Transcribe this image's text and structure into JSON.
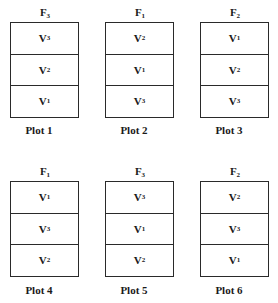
{
  "diagram": {
    "title": "",
    "plots": [
      {
        "label": "Plot 1",
        "factor": {
          "base": "F",
          "sub": "3"
        },
        "varieties": [
          {
            "base": "V",
            "sub": "3"
          },
          {
            "base": "V",
            "sub": "2"
          },
          {
            "base": "V",
            "sub": "1"
          }
        ]
      },
      {
        "label": "Plot 2",
        "factor": {
          "base": "F",
          "sub": "1"
        },
        "varieties": [
          {
            "base": "V",
            "sub": "2"
          },
          {
            "base": "V",
            "sub": "1"
          },
          {
            "base": "V",
            "sub": "3"
          }
        ]
      },
      {
        "label": "Plot 3",
        "factor": {
          "base": "F",
          "sub": "2"
        },
        "varieties": [
          {
            "base": "V",
            "sub": "1"
          },
          {
            "base": "V",
            "sub": "2"
          },
          {
            "base": "V",
            "sub": "3"
          }
        ]
      },
      {
        "label": "Plot 4",
        "factor": {
          "base": "F",
          "sub": "1"
        },
        "varieties": [
          {
            "base": "V",
            "sub": "1"
          },
          {
            "base": "V",
            "sub": "3"
          },
          {
            "base": "V",
            "sub": "2"
          }
        ]
      },
      {
        "label": "Plot 5",
        "factor": {
          "base": "F",
          "sub": "3"
        },
        "varieties": [
          {
            "base": "V",
            "sub": "3"
          },
          {
            "base": "V",
            "sub": "1"
          },
          {
            "base": "V",
            "sub": "2"
          }
        ]
      },
      {
        "label": "Plot 6",
        "factor": {
          "base": "F",
          "sub": "2"
        },
        "varieties": [
          {
            "base": "V",
            "sub": "2"
          },
          {
            "base": "V",
            "sub": "3"
          },
          {
            "base": "V",
            "sub": "1"
          }
        ]
      }
    ]
  }
}
